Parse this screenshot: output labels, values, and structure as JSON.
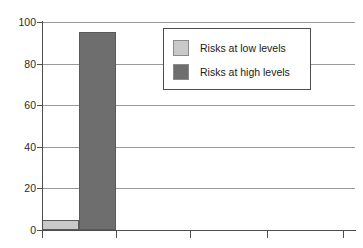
{
  "chart_data": {
    "type": "bar",
    "title": "",
    "xlabel": "",
    "ylabel": "",
    "ylim": [
      0,
      100
    ],
    "yticks": [
      0,
      20,
      40,
      60,
      80,
      100
    ],
    "ytick_labels": [
      "0",
      "20",
      "40",
      "60",
      "80",
      "100"
    ],
    "xticks": [
      0,
      1,
      2,
      3,
      4
    ],
    "xtick_labels": [
      "",
      "",
      "",
      "",
      ""
    ],
    "categories": [
      "Risk level"
    ],
    "grid": "horizontal",
    "legend_position": "upper center",
    "series": [
      {
        "name": "Risks at low levels",
        "color": "#c9c9c9",
        "values": [
          5
        ]
      },
      {
        "name": "Risks at high levels",
        "color": "#6e6e6e",
        "values": [
          95
        ]
      }
    ]
  },
  "legend": {
    "items": [
      {
        "label": "Risks at low levels",
        "color": "#c9c9c9"
      },
      {
        "label": "Risks at high levels",
        "color": "#6e6e6e"
      }
    ]
  },
  "axis": {
    "y_labels": [
      "100",
      "80",
      "60",
      "40",
      "20",
      "0"
    ]
  },
  "colors": {
    "low": "#c9c9c9",
    "high": "#6e6e6e",
    "grid": "#9a9a9a",
    "axis": "#4d4d4d",
    "background": "#ffffff"
  }
}
